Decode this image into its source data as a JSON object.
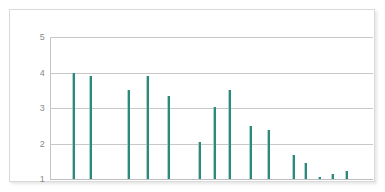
{
  "chart_data": {
    "type": "bar",
    "title": "",
    "subtitle": "",
    "xlabel": "",
    "ylabel": "",
    "grid": true,
    "legend": null,
    "legend_position": "none",
    "series_color": "#2c8a7c",
    "grid_color": "#c8c8c8",
    "axis_color": "#c4c4c4",
    "tick_label_color": "#8a8a8a",
    "frame_color": "#d9d9d9",
    "background": "#ffffff",
    "ylim": [
      1,
      5
    ],
    "yticks": [
      1,
      2,
      3,
      4,
      5
    ],
    "ytick_labels": [
      "1",
      "2",
      "3",
      "4",
      "5"
    ],
    "xlim": [
      0,
      100
    ],
    "xticks": [],
    "xtick_labels": [],
    "x": [
      7.1,
      12.4,
      24.1,
      30.0,
      36.5,
      46.1,
      50.8,
      55.4,
      61.9,
      67.5,
      75.2,
      78.9,
      83.3,
      87.3,
      91.6
    ],
    "values": [
      4.0,
      3.9,
      3.52,
      3.9,
      3.35,
      2.04,
      3.02,
      3.5,
      2.49,
      2.37,
      1.69,
      1.44,
      1.06,
      1.13,
      1.23
    ],
    "categories": [
      "1",
      "2",
      "3",
      "4",
      "5",
      "6",
      "7",
      "8",
      "9",
      "10",
      "11",
      "12",
      "13",
      "14",
      "15"
    ],
    "points": [
      {
        "x": 7.1,
        "value": 4.0
      },
      {
        "x": 12.4,
        "value": 3.9
      },
      {
        "x": 24.1,
        "value": 3.52
      },
      {
        "x": 30.0,
        "value": 3.9
      },
      {
        "x": 36.5,
        "value": 3.35
      },
      {
        "x": 46.1,
        "value": 2.04
      },
      {
        "x": 50.8,
        "value": 3.02
      },
      {
        "x": 55.4,
        "value": 3.5
      },
      {
        "x": 61.9,
        "value": 2.49
      },
      {
        "x": 67.5,
        "value": 2.37
      },
      {
        "x": 75.2,
        "value": 1.69
      },
      {
        "x": 78.9,
        "value": 1.44
      },
      {
        "x": 83.3,
        "value": 1.06
      },
      {
        "x": 87.3,
        "value": 1.13
      },
      {
        "x": 91.6,
        "value": 1.23
      }
    ]
  }
}
